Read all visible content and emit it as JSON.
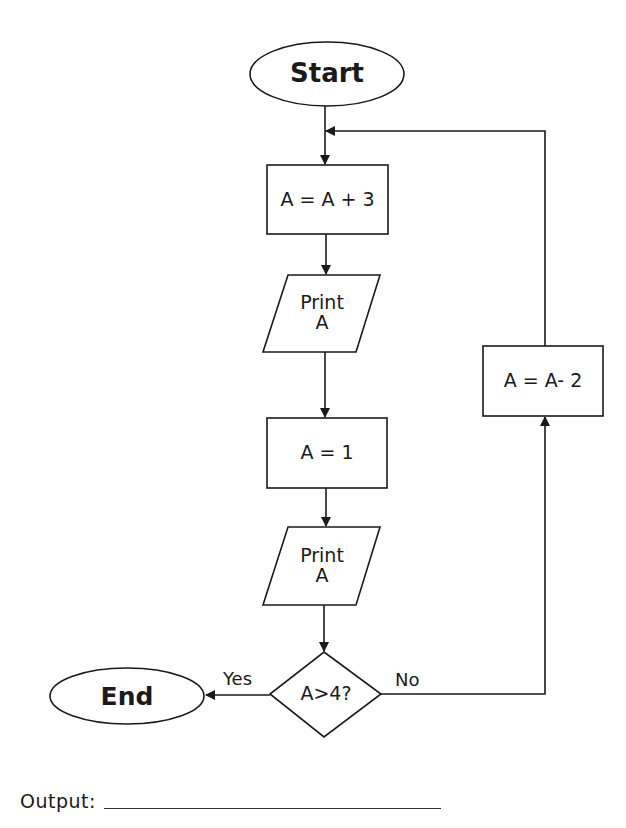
{
  "flowchart": {
    "nodes": {
      "start": {
        "label": "Start",
        "shape": "terminator"
      },
      "add3": {
        "label": "A = A + 3",
        "shape": "process"
      },
      "print1": {
        "label": "Print\nA",
        "shape": "io"
      },
      "set1": {
        "label": "A = 1",
        "shape": "process"
      },
      "print2": {
        "label": "Print\nA",
        "shape": "io"
      },
      "decision": {
        "label": "A>4?",
        "shape": "decision"
      },
      "end": {
        "label": "End",
        "shape": "terminator"
      },
      "sub2": {
        "label": "A = A- 2",
        "shape": "process"
      }
    },
    "edges": [
      {
        "from": "start",
        "to": "add3",
        "label": ""
      },
      {
        "from": "add3",
        "to": "print1",
        "label": ""
      },
      {
        "from": "print1",
        "to": "set1",
        "label": ""
      },
      {
        "from": "set1",
        "to": "print2",
        "label": ""
      },
      {
        "from": "print2",
        "to": "decision",
        "label": ""
      },
      {
        "from": "decision",
        "to": "end",
        "label": "Yes"
      },
      {
        "from": "decision",
        "to": "sub2",
        "label": "No"
      },
      {
        "from": "sub2",
        "to": "add3",
        "label": ""
      }
    ],
    "edge_labels": {
      "yes": "Yes",
      "no": "No"
    }
  },
  "answer": {
    "label": "Output:",
    "value": ""
  },
  "colors": {
    "stroke": "#1a1a1a",
    "background": "#ffffff"
  }
}
